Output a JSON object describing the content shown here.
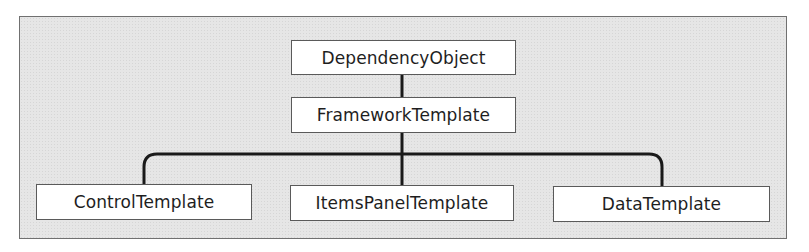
{
  "diagram": {
    "type": "class-hierarchy",
    "colors": {
      "frame_fill": "#e6e6e6",
      "frame_border": "#707070",
      "node_fill": "#ffffff",
      "node_border": "#5a5a5a",
      "edge": "#1a1a1a",
      "text": "#1e1e1e"
    },
    "nodes": [
      {
        "id": "dependency-object",
        "label": "DependencyObject",
        "level": 0
      },
      {
        "id": "framework-template",
        "label": "FrameworkTemplate",
        "level": 1,
        "parent": "dependency-object"
      },
      {
        "id": "control-template",
        "label": "ControlTemplate",
        "level": 2,
        "parent": "framework-template"
      },
      {
        "id": "items-panel-template",
        "label": "ItemsPanelTemplate",
        "level": 2,
        "parent": "framework-template"
      },
      {
        "id": "data-template",
        "label": "DataTemplate",
        "level": 2,
        "parent": "framework-template"
      }
    ],
    "edges": [
      {
        "from": "dependency-object",
        "to": "framework-template"
      },
      {
        "from": "framework-template",
        "to": "control-template"
      },
      {
        "from": "framework-template",
        "to": "items-panel-template"
      },
      {
        "from": "framework-template",
        "to": "data-template"
      }
    ]
  }
}
